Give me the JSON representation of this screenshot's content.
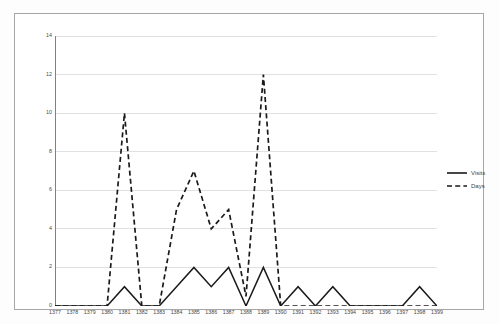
{
  "chart_data": {
    "type": "line",
    "title": "",
    "subtitle": "",
    "xlabel": "",
    "ylabel": "",
    "categories": [
      "1377",
      "1378",
      "1379",
      "1380",
      "1381",
      "1382",
      "1383",
      "1384",
      "1385",
      "1386",
      "1387",
      "1388",
      "1389",
      "1390",
      "1391",
      "1392",
      "1393",
      "1394",
      "1395",
      "1396",
      "1397",
      "1398",
      "1399"
    ],
    "series": [
      {
        "name": "Visits",
        "style": "solid",
        "color": "#1a1a1a",
        "values": [
          0,
          0,
          0,
          0,
          1,
          0,
          0,
          1,
          2,
          1,
          2,
          0,
          2,
          0,
          1,
          0,
          1,
          0,
          0,
          0,
          0,
          1,
          0
        ]
      },
      {
        "name": "Days",
        "style": "dashed",
        "color": "#1a1a1a",
        "values": [
          0,
          0,
          0,
          0,
          10,
          0,
          0,
          5,
          7,
          4,
          5,
          0.5,
          12,
          0,
          0,
          0,
          0,
          0,
          0,
          0,
          0,
          0,
          0
        ]
      }
    ],
    "ylim": [
      0,
      14
    ],
    "yticks": [
      "0",
      "2",
      "4",
      "6",
      "8",
      "10",
      "12",
      "14"
    ],
    "grid": true,
    "grid_axis": "y",
    "legend_position": "right",
    "axis_color": "#808080",
    "grid_color": "#d9d9d9",
    "plot_background": "#ffffff",
    "frame_color": "#a6a6a6"
  },
  "legend": {
    "entries": [
      {
        "label": "Visits",
        "style": "solid"
      },
      {
        "label": "Days",
        "style": "dashed"
      }
    ]
  }
}
